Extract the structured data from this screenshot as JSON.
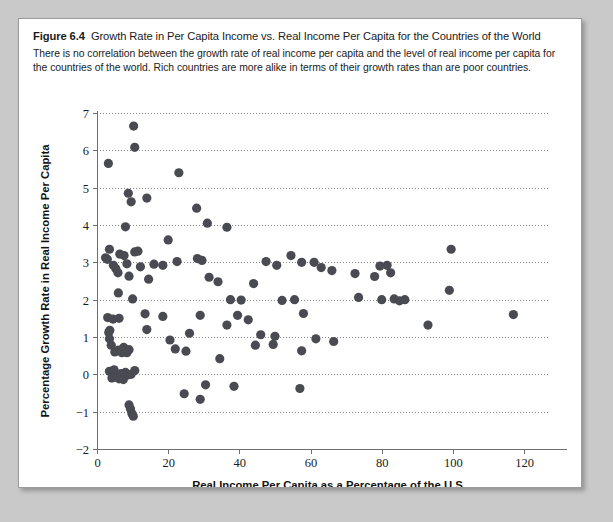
{
  "figure": {
    "label": "Figure 6.4",
    "title": "Growth Rate in Per Capita Income vs. Real Income Per Capita for the Countries of the World",
    "caption": "There is no correlation between the growth rate of real income per capita and the level of real income per capita for the countries of the world. Rich countries are more alike in terms of their growth rates than are poor countries.",
    "background_color": "#c9c9c9",
    "card_color": "#ffffff",
    "point_color": "#4a4a52",
    "gridline_color": "#8a8a8a",
    "axis_color": "#6e6e6e"
  },
  "chart_data": {
    "type": "scatter",
    "title": "Growth Rate in Per Capita Income vs. Real Income Per Capita for the Countries of the World",
    "xlabel": "Real Income Per Capita as a Percentage of the U.S.",
    "ylabel": "Percentage Growth Rate in Real Income Per Capita",
    "xlim": [
      0,
      127
    ],
    "ylim": [
      -2,
      7
    ],
    "xticks": [
      0,
      20,
      40,
      60,
      80,
      100,
      120
    ],
    "xtick_labels": [
      "0",
      "20",
      "40",
      "60",
      "80",
      "100",
      "120"
    ],
    "yticks": [
      -2,
      -1,
      0,
      1,
      2,
      3,
      4,
      5,
      6,
      7
    ],
    "ytick_labels": [
      "-2",
      "-1",
      "0",
      "1",
      "2",
      "3",
      "4",
      "5",
      "6",
      "7"
    ],
    "grid": true,
    "grid_axis": "y",
    "grid_style": "dotted",
    "legend": null,
    "marker": "circle",
    "marker_size": 4.6,
    "points": [
      [
        3.2,
        5.65
      ],
      [
        10.3,
        6.65
      ],
      [
        10.6,
        6.08
      ],
      [
        23.0,
        5.4
      ],
      [
        8.8,
        4.85
      ],
      [
        9.6,
        4.62
      ],
      [
        14.0,
        4.72
      ],
      [
        28.0,
        4.45
      ],
      [
        8.0,
        3.95
      ],
      [
        31.0,
        4.05
      ],
      [
        36.5,
        3.94
      ],
      [
        2.4,
        3.12
      ],
      [
        2.9,
        3.08
      ],
      [
        3.5,
        3.35
      ],
      [
        4.6,
        2.92
      ],
      [
        5.3,
        2.83
      ],
      [
        5.9,
        2.72
      ],
      [
        6.4,
        3.22
      ],
      [
        7.6,
        3.18
      ],
      [
        8.4,
        2.96
      ],
      [
        9.0,
        2.63
      ],
      [
        10.6,
        3.28
      ],
      [
        11.5,
        3.3
      ],
      [
        12.2,
        2.88
      ],
      [
        14.5,
        2.55
      ],
      [
        16.0,
        2.95
      ],
      [
        18.5,
        2.92
      ],
      [
        20.0,
        3.6
      ],
      [
        22.5,
        3.02
      ],
      [
        28.2,
        3.1
      ],
      [
        29.5,
        3.05
      ],
      [
        31.5,
        2.6
      ],
      [
        34.0,
        2.48
      ],
      [
        47.5,
        3.02
      ],
      [
        50.5,
        2.92
      ],
      [
        54.5,
        3.18
      ],
      [
        57.5,
        3.0
      ],
      [
        61.0,
        3.0
      ],
      [
        63.0,
        2.86
      ],
      [
        66.0,
        2.78
      ],
      [
        72.5,
        2.7
      ],
      [
        78.0,
        2.62
      ],
      [
        79.5,
        2.9
      ],
      [
        81.5,
        2.92
      ],
      [
        82.5,
        2.72
      ],
      [
        99.5,
        3.35
      ],
      [
        6.0,
        2.18
      ],
      [
        10.0,
        2.02
      ],
      [
        13.5,
        1.62
      ],
      [
        37.5,
        2.0
      ],
      [
        40.5,
        1.99
      ],
      [
        44.0,
        2.43
      ],
      [
        52.0,
        1.98
      ],
      [
        55.5,
        2.0
      ],
      [
        73.5,
        2.06
      ],
      [
        80.0,
        2.0
      ],
      [
        83.5,
        2.02
      ],
      [
        85.0,
        1.97
      ],
      [
        86.5,
        2.0
      ],
      [
        99.0,
        2.25
      ],
      [
        3.0,
        1.52
      ],
      [
        4.5,
        1.48
      ],
      [
        6.2,
        1.5
      ],
      [
        18.5,
        1.55
      ],
      [
        29.0,
        1.58
      ],
      [
        36.5,
        1.32
      ],
      [
        39.5,
        1.58
      ],
      [
        42.5,
        1.46
      ],
      [
        58.0,
        1.63
      ],
      [
        93.0,
        1.32
      ],
      [
        117.0,
        1.6
      ],
      [
        3.3,
        1.12
      ],
      [
        3.5,
        0.95
      ],
      [
        3.6,
        1.18
      ],
      [
        14.0,
        1.2
      ],
      [
        20.5,
        0.92
      ],
      [
        26.0,
        1.1
      ],
      [
        46.0,
        1.06
      ],
      [
        50.0,
        1.02
      ],
      [
        61.5,
        0.95
      ],
      [
        66.5,
        0.88
      ],
      [
        4.0,
        0.78
      ],
      [
        5.0,
        0.6
      ],
      [
        6.0,
        0.65
      ],
      [
        7.0,
        0.58
      ],
      [
        7.5,
        0.72
      ],
      [
        8.4,
        0.58
      ],
      [
        9.0,
        0.66
      ],
      [
        22.0,
        0.68
      ],
      [
        25.0,
        0.62
      ],
      [
        34.5,
        0.42
      ],
      [
        44.5,
        0.78
      ],
      [
        49.5,
        0.8
      ],
      [
        57.5,
        0.63
      ],
      [
        3.5,
        0.08
      ],
      [
        4.2,
        -0.1
      ],
      [
        4.8,
        0.12
      ],
      [
        5.6,
        -0.08
      ],
      [
        6.2,
        -0.12
      ],
      [
        6.8,
        0.02
      ],
      [
        7.4,
        -0.14
      ],
      [
        8.0,
        0.05
      ],
      [
        8.6,
        -0.02
      ],
      [
        9.6,
        0.0
      ],
      [
        10.6,
        0.1
      ],
      [
        24.5,
        -0.52
      ],
      [
        30.5,
        -0.28
      ],
      [
        38.5,
        -0.32
      ],
      [
        57.0,
        -0.38
      ],
      [
        9.0,
        -0.82
      ],
      [
        9.4,
        -0.92
      ],
      [
        9.8,
        -1.05
      ],
      [
        10.2,
        -1.12
      ],
      [
        29.0,
        -0.67
      ]
    ]
  }
}
